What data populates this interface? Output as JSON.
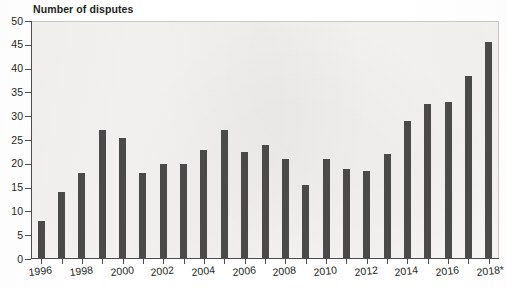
{
  "chart_data": {
    "type": "bar",
    "title": "Number of disputes",
    "xlabel": "",
    "ylabel": "",
    "ylim": [
      0,
      50
    ],
    "ytick_step": 5,
    "yticks": [
      0,
      5,
      10,
      15,
      20,
      25,
      30,
      35,
      40,
      45,
      50
    ],
    "grid": false,
    "legend": null,
    "bar_color": "#4a4a4a",
    "plot_background": "#f6f5f3",
    "axis_color": "#4d4d4d",
    "text_color": "#231f20",
    "xtick_labels_shown": [
      "1996",
      "1998",
      "2000",
      "2002",
      "2004",
      "2006",
      "2008",
      "2010",
      "2012",
      "2014",
      "2016",
      "2018*"
    ],
    "categories": [
      "1996",
      "1997",
      "1998",
      "1999",
      "2000",
      "2001",
      "2002",
      "2003",
      "2004",
      "2005",
      "2006",
      "2007",
      "2008",
      "2009",
      "2010",
      "2011",
      "2012",
      "2013",
      "2014",
      "2015",
      "2016",
      "2017",
      "2018*"
    ],
    "values": [
      8,
      14,
      18,
      27,
      25.5,
      18,
      20,
      20,
      23,
      27,
      22.5,
      24,
      21,
      15.5,
      21,
      19,
      18.5,
      22,
      29,
      32.5,
      33,
      38.5,
      45.5
    ],
    "annotations": [
      "* 2018 value is provisional / partial, as indicated by the asterisk on the axis label"
    ]
  }
}
